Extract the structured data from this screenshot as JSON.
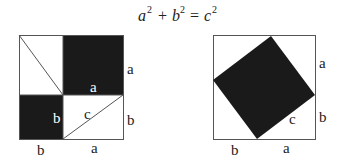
{
  "title": {
    "terms": [
      {
        "base": "a",
        "exp": "2"
      },
      {
        "op": "+"
      },
      {
        "base": "b",
        "exp": "2"
      },
      {
        "op": "="
      },
      {
        "base": "c",
        "exp": "2"
      }
    ]
  },
  "colors": {
    "fill": "#1a1a1a",
    "stroke": "#555555",
    "background": "#ffffff"
  },
  "left_figure": {
    "labels": {
      "right_top": "a",
      "right_bottom": "b",
      "bottom_left": "b",
      "bottom_right": "a",
      "inner_a": "a",
      "inner_b": "b",
      "hypotenuse": "c"
    }
  },
  "right_figure": {
    "labels": {
      "right_top": "a",
      "right_bottom": "b",
      "bottom_left": "b",
      "bottom_right": "a",
      "hypotenuse": "c"
    }
  }
}
